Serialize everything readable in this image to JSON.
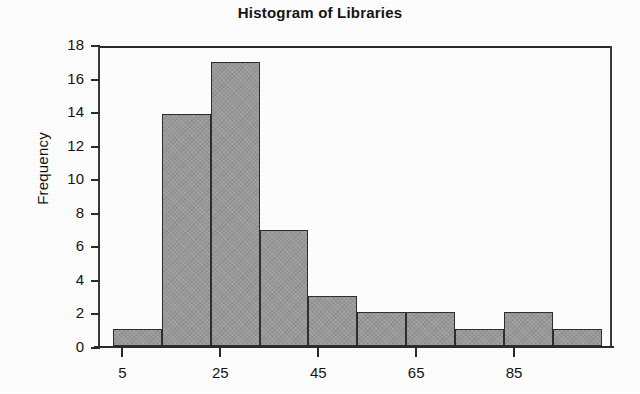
{
  "chart_data": {
    "type": "bar",
    "title": "Histogram of Libraries",
    "xlabel": "",
    "ylabel": "Frequency",
    "grid": false,
    "legend": null,
    "xlim": [
      0,
      105
    ],
    "ylim": [
      0,
      18
    ],
    "y_ticks": [
      0,
      2,
      4,
      6,
      8,
      10,
      12,
      14,
      16,
      18
    ],
    "y_tick_labels": [
      "0",
      "2",
      "4",
      "6",
      "8",
      "10",
      "12",
      "14",
      "16",
      "18"
    ],
    "x_ticks": [
      5,
      25,
      45,
      65,
      85
    ],
    "x_tick_labels": [
      "5",
      "25",
      "45",
      "65",
      "85"
    ],
    "bin_width": 10,
    "bin_edges": [
      3,
      13,
      23,
      33,
      43,
      53,
      63,
      73,
      83,
      93,
      103
    ],
    "categories": [
      "3-13",
      "13-23",
      "23-33",
      "33-43",
      "43-53",
      "53-63",
      "63-73",
      "73-83",
      "83-93",
      "93-103"
    ],
    "values": [
      1,
      13.8,
      16.9,
      6.9,
      3,
      2,
      2,
      1,
      2,
      1
    ],
    "bar_fill_color": "#9a9a9a",
    "bar_edge_color": "#2e2e2e",
    "axis_color": "#2b2b2b",
    "background_color": "#ffffff"
  }
}
